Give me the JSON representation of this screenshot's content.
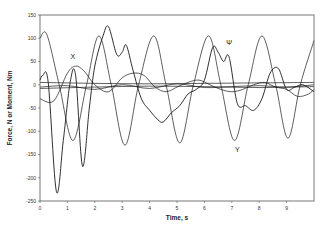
{
  "chart_data": {
    "type": "line",
    "title": "",
    "xlabel": "Time, s",
    "ylabel": "Force, N or Moment, Nm",
    "xlim": [
      0,
      10
    ],
    "ylim": [
      -250,
      150
    ],
    "x_ticks": [
      0,
      1,
      2,
      3,
      4,
      5,
      6,
      7,
      8,
      9
    ],
    "y_ticks": [
      150,
      100,
      50,
      0,
      -50,
      -100,
      -150,
      -200,
      -250
    ],
    "grid": false,
    "legend": "none (inline labels)",
    "annotations": [
      {
        "text": "X",
        "x": 1.2,
        "y": 55
      },
      {
        "text": "Ψ",
        "x": 6.9,
        "y": 85
      },
      {
        "text": "Y",
        "x": 7.2,
        "y": -145
      }
    ],
    "series": [
      {
        "name": "Y",
        "x": [
          0,
          0.25,
          0.7,
          1.2,
          1.7,
          2.15,
          2.6,
          3.1,
          3.6,
          4.15,
          4.6,
          5.1,
          5.6,
          6.15,
          6.6,
          7.1,
          7.6,
          8.1,
          8.6,
          9.05,
          9.5,
          10
        ],
        "values": [
          100,
          108,
          0,
          -120,
          0,
          105,
          0,
          -130,
          0,
          105,
          0,
          -125,
          0,
          105,
          0,
          -120,
          0,
          105,
          0,
          -115,
          0,
          95
        ]
      },
      {
        "name": "Ψ",
        "x": [
          0,
          0.1,
          0.3,
          0.6,
          0.85,
          1.1,
          1.3,
          1.55,
          1.8,
          2.0,
          2.3,
          2.5,
          2.8,
          3.0,
          3.15,
          3.4,
          3.7,
          4.0,
          4.3,
          4.5,
          4.8,
          5.1,
          5.4,
          5.7,
          6.0,
          6.3,
          6.5,
          6.7,
          6.9,
          7.2,
          7.5,
          7.8,
          8.1,
          8.4,
          8.7,
          9.0,
          9.3,
          9.6,
          10
        ],
        "values": [
          10,
          20,
          5,
          -230,
          -120,
          5,
          20,
          -175,
          -50,
          40,
          105,
          125,
          65,
          70,
          85,
          30,
          -30,
          -55,
          -75,
          -80,
          -60,
          -45,
          -20,
          -10,
          10,
          80,
          70,
          50,
          60,
          -40,
          -45,
          -55,
          -30,
          25,
          35,
          -10,
          -5,
          0,
          -15
        ]
      },
      {
        "name": "X",
        "x": [
          0,
          0.5,
          1.0,
          1.3,
          1.6,
          2.0,
          2.5,
          3.0,
          3.4,
          3.8,
          4.2,
          4.6,
          5.0,
          5.4,
          5.8,
          6.2,
          6.6,
          7.0,
          7.4,
          7.8,
          8.2,
          8.6,
          9.0,
          9.4,
          9.8,
          10
        ],
        "values": [
          -30,
          -35,
          25,
          40,
          30,
          0,
          -15,
          15,
          25,
          20,
          -5,
          -15,
          -5,
          5,
          10,
          0,
          -10,
          -15,
          -10,
          0,
          5,
          -5,
          -10,
          -25,
          -20,
          -10
        ]
      },
      {
        "name": "Line A",
        "x": [
          0,
          2,
          4,
          6,
          8,
          10
        ],
        "values": [
          5,
          3,
          2,
          3,
          4,
          5
        ]
      },
      {
        "name": "Line B",
        "x": [
          0,
          2,
          4,
          6,
          8,
          10
        ],
        "values": [
          -8,
          -5,
          -3,
          -4,
          -6,
          -4
        ]
      },
      {
        "name": "Line C",
        "x": [
          0,
          1,
          2,
          3,
          4,
          5,
          6,
          7,
          8,
          9,
          10
        ],
        "values": [
          -5,
          -2,
          -10,
          0,
          -8,
          2,
          -6,
          -4,
          -2,
          -5,
          0
        ]
      }
    ]
  }
}
